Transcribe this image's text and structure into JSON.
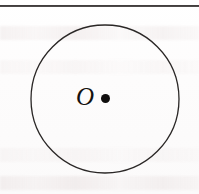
{
  "figure": {
    "kind": "geometry-diagram",
    "background_color": "#fdfdfd",
    "ink_color": "#201d1c",
    "rule": {
      "present": true,
      "color": "#2e2b2b",
      "x": 0,
      "y": 5,
      "width": 199,
      "height": 2
    },
    "circle": {
      "center_x": 105,
      "center_y": 99,
      "radius": 74,
      "stroke_color": "#2a2726",
      "stroke_width": 1.3,
      "fill": "none"
    },
    "center_point": {
      "label": "O",
      "dot_x": 105.5,
      "dot_y": 98.5,
      "dot_radius": 4.5,
      "dot_color": "#100e0d",
      "label_x": 76,
      "label_y": 84,
      "label_style": "italic-serif"
    }
  }
}
